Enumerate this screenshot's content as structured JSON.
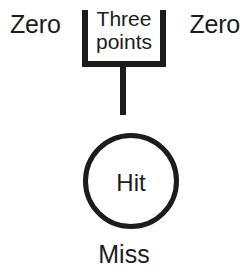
{
  "diagram": {
    "background_color": "#ffffff",
    "stroke_color": "#1c1c1c",
    "zones": {
      "left_zero_label": "Zero",
      "right_zero_label": "Zero",
      "bracket_label_line1": "Three",
      "bracket_label_line2": "points",
      "circle_label": "Hit",
      "below_circle_label": "Miss"
    },
    "shapes": {
      "bracket_name": "u-bracket-three-points",
      "post_name": "vertical-post",
      "circle_name": "hit-target-circle"
    }
  }
}
